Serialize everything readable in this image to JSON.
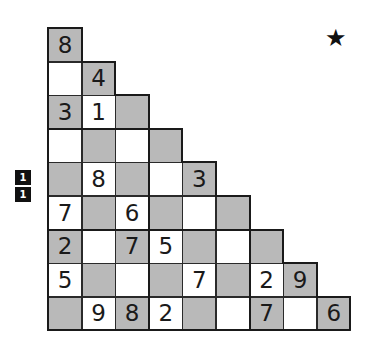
{
  "puzzle": {
    "type": "staircase-number-grid",
    "rows": [
      [
        {
          "v": "8",
          "s": "g"
        }
      ],
      [
        {
          "v": "",
          "s": "w"
        },
        {
          "v": "4",
          "s": "g"
        }
      ],
      [
        {
          "v": "3",
          "s": "g"
        },
        {
          "v": "1",
          "s": "w"
        },
        {
          "v": "",
          "s": "g"
        }
      ],
      [
        {
          "v": "",
          "s": "w"
        },
        {
          "v": "",
          "s": "g"
        },
        {
          "v": "",
          "s": "w"
        },
        {
          "v": "",
          "s": "g"
        }
      ],
      [
        {
          "v": "",
          "s": "g"
        },
        {
          "v": "8",
          "s": "w"
        },
        {
          "v": "",
          "s": "g"
        },
        {
          "v": "",
          "s": "w"
        },
        {
          "v": "3",
          "s": "g"
        }
      ],
      [
        {
          "v": "7",
          "s": "w"
        },
        {
          "v": "",
          "s": "g"
        },
        {
          "v": "6",
          "s": "w"
        },
        {
          "v": "",
          "s": "g"
        },
        {
          "v": "",
          "s": "w"
        },
        {
          "v": "",
          "s": "g"
        }
      ],
      [
        {
          "v": "2",
          "s": "g"
        },
        {
          "v": "",
          "s": "w"
        },
        {
          "v": "7",
          "s": "g"
        },
        {
          "v": "5",
          "s": "w"
        },
        {
          "v": "",
          "s": "g"
        },
        {
          "v": "",
          "s": "w"
        },
        {
          "v": "",
          "s": "g"
        }
      ],
      [
        {
          "v": "5",
          "s": "w"
        },
        {
          "v": "",
          "s": "g"
        },
        {
          "v": "",
          "s": "w"
        },
        {
          "v": "",
          "s": "g"
        },
        {
          "v": "7",
          "s": "w"
        },
        {
          "v": "",
          "s": "g"
        },
        {
          "v": "2",
          "s": "w"
        },
        {
          "v": "9",
          "s": "g"
        }
      ],
      [
        {
          "v": "",
          "s": "g"
        },
        {
          "v": "9",
          "s": "w"
        },
        {
          "v": "8",
          "s": "g"
        },
        {
          "v": "2",
          "s": "w"
        },
        {
          "v": "",
          "s": "g"
        },
        {
          "v": "",
          "s": "w"
        },
        {
          "v": "7",
          "s": "g"
        },
        {
          "v": "",
          "s": "w"
        },
        {
          "v": "6",
          "s": "g"
        }
      ]
    ]
  },
  "badges": [
    "1",
    "1"
  ],
  "difficulty_icon": "star-icon",
  "difficulty_glyph": "★",
  "colors": {
    "shaded": "#b9b9b9",
    "plain": "#ffffff",
    "line": "#1a1a1a"
  }
}
